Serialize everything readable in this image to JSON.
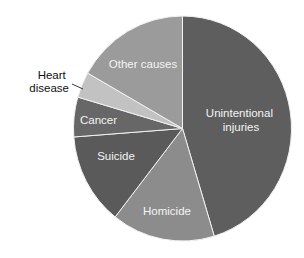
{
  "chart_data": {
    "type": "pie",
    "title": "",
    "start_angle_deg": 0,
    "direction": "clockwise",
    "categories": [
      "Unintentional injuries",
      "Homicide",
      "Suicide",
      "Cancer",
      "Heart disease",
      "Other causes"
    ],
    "values": [
      45.3,
      15.3,
      13.2,
      5.7,
      3.7,
      16.8
    ],
    "unit": "percent (estimated from slice angles)",
    "colors": [
      "#5e5e5e",
      "#8c8c8c",
      "#5a5a5a",
      "#676767",
      "#c2c2c2",
      "#9b9b9b"
    ],
    "labels": [
      {
        "lines": [
          "Unintentional",
          "injuries"
        ],
        "placement": "inside"
      },
      {
        "lines": [
          "Homicide"
        ],
        "placement": "inside"
      },
      {
        "lines": [
          "Suicide"
        ],
        "placement": "inside"
      },
      {
        "lines": [
          "Cancer"
        ],
        "placement": "inside"
      },
      {
        "lines": [
          "Heart",
          "disease"
        ],
        "placement": "outside-with-leader-line"
      },
      {
        "lines": [
          "Other causes"
        ],
        "placement": "inside"
      }
    ],
    "legend": "none",
    "grid": false
  }
}
